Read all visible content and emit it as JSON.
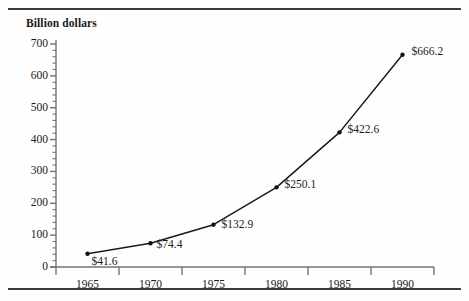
{
  "figure": {
    "background_color": "#fefefe",
    "rule_color": "#3b3b3b",
    "axis_color": "#737373",
    "line_color": "#1a1a1a",
    "marker_color": "#111111",
    "text_color": "#1a1a1a"
  },
  "chart_data": {
    "type": "line",
    "title": "",
    "ylabel": "Billion dollars",
    "xlabel": "",
    "categories": [
      "1965",
      "1970",
      "1975",
      "1980",
      "1985",
      "1990"
    ],
    "x": [
      1965,
      1970,
      1975,
      1980,
      1985,
      1990
    ],
    "values": [
      41.6,
      74.4,
      132.9,
      250.1,
      422.6,
      666.2
    ],
    "point_labels": [
      "$41.6",
      "$74.4",
      "$132.9",
      "$250.1",
      "$422.6",
      "$666.2"
    ],
    "ylim": [
      0,
      700
    ],
    "yticks": [
      0,
      100,
      200,
      300,
      400,
      500,
      600,
      700
    ],
    "ytick_labels": [
      "0",
      "100",
      "200",
      "300",
      "400",
      "500",
      "600",
      "700"
    ],
    "yminor_interval": 20,
    "grid": false,
    "legend": null,
    "marker": "dot",
    "xtick_style": "category-boundaries"
  }
}
